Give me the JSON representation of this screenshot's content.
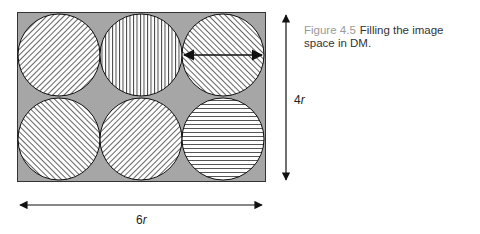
{
  "caption": {
    "label": "Figure 4.5",
    "text": "Filling the image space in DM."
  },
  "diagram": {
    "width_label_prefix": "6",
    "width_label_var": "r",
    "height_label_prefix": "4",
    "height_label_var": "r",
    "background_color": "#a6a6a6",
    "circle_fill": "#ffffff",
    "stroke_color": "#111111",
    "circles": [
      {
        "row": 1,
        "col": 1,
        "pattern": "diagonal-backslash"
      },
      {
        "row": 1,
        "col": 2,
        "pattern": "vertical"
      },
      {
        "row": 1,
        "col": 3,
        "pattern": "diagonal-slash",
        "annotation": "diameter-arrow"
      },
      {
        "row": 2,
        "col": 1,
        "pattern": "diagonal-slash"
      },
      {
        "row": 2,
        "col": 2,
        "pattern": "diagonal-backslash"
      },
      {
        "row": 2,
        "col": 3,
        "pattern": "horizontal"
      }
    ]
  }
}
